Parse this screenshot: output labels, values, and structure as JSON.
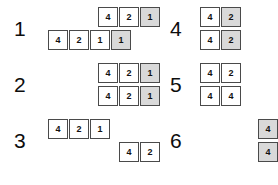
{
  "figure": {
    "cell_border_color": "#4a4a4a",
    "cell_shaded_color": "#d9d9d9",
    "cell_background_color": "#ffffff",
    "text_color": "#111111",
    "background_color": "#ffffff"
  },
  "columns": [
    {
      "side": "left",
      "groups": [
        {
          "label": "1",
          "track": "4",
          "rows": [
            {
              "align": "right",
              "cells": [
                {
                  "value": "4",
                  "shaded": false
                },
                {
                  "value": "2",
                  "shaded": false
                },
                {
                  "value": "1",
                  "shaded": true
                }
              ]
            },
            {
              "align": "left",
              "cells": [
                {
                  "value": "4",
                  "shaded": false
                },
                {
                  "value": "2",
                  "shaded": false
                },
                {
                  "value": "1",
                  "shaded": false
                },
                {
                  "value": "1",
                  "shaded": true
                }
              ]
            }
          ]
        },
        {
          "label": "2",
          "track": "3",
          "rows": [
            {
              "align": "right",
              "cells": [
                {
                  "value": "4",
                  "shaded": false
                },
                {
                  "value": "2",
                  "shaded": false
                },
                {
                  "value": "1",
                  "shaded": true
                }
              ]
            },
            {
              "align": "right",
              "cells": [
                {
                  "value": "4",
                  "shaded": false
                },
                {
                  "value": "2",
                  "shaded": false
                },
                {
                  "value": "1",
                  "shaded": true
                }
              ]
            }
          ]
        },
        {
          "label": "3",
          "track": "3",
          "rows": [
            {
              "align": "left",
              "cells": [
                {
                  "value": "4",
                  "shaded": false
                },
                {
                  "value": "2",
                  "shaded": false
                },
                {
                  "value": "1",
                  "shaded": false
                }
              ]
            },
            {
              "align": "right",
              "cells": [
                {
                  "value": "4",
                  "shaded": false
                },
                {
                  "value": "2",
                  "shaded": false
                }
              ]
            }
          ]
        }
      ]
    },
    {
      "side": "right",
      "groups": [
        {
          "label": "4",
          "track": "r2",
          "rows": [
            {
              "align": "left",
              "cells": [
                {
                  "value": "4",
                  "shaded": false
                },
                {
                  "value": "2",
                  "shaded": true
                }
              ]
            },
            {
              "align": "left",
              "cells": [
                {
                  "value": "4",
                  "shaded": false
                },
                {
                  "value": "2",
                  "shaded": true
                }
              ]
            }
          ]
        },
        {
          "label": "5",
          "track": "r2",
          "rows": [
            {
              "align": "left",
              "cells": [
                {
                  "value": "4",
                  "shaded": false
                },
                {
                  "value": "2",
                  "shaded": false
                }
              ]
            },
            {
              "align": "left",
              "cells": [
                {
                  "value": "4",
                  "shaded": false
                },
                {
                  "value": "4",
                  "shaded": false
                }
              ]
            }
          ]
        },
        {
          "label": "6",
          "track": "r2",
          "rows": [
            {
              "align": "right",
              "cells": [
                {
                  "value": "4",
                  "shaded": true
                }
              ]
            },
            {
              "align": "right",
              "cells": [
                {
                  "value": "4",
                  "shaded": true
                }
              ]
            }
          ]
        }
      ]
    }
  ]
}
